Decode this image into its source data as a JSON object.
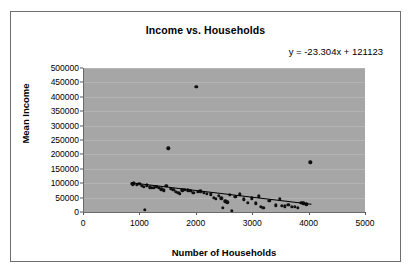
{
  "chart_data": {
    "type": "scatter",
    "title": "Income vs. Households",
    "xlabel": "Number of Households",
    "ylabel": "Mean Income",
    "xlim": [
      0,
      5000
    ],
    "ylim": [
      0,
      500000
    ],
    "xticks": [
      0,
      1000,
      2000,
      3000,
      4000,
      5000
    ],
    "yticks": [
      0,
      50000,
      100000,
      150000,
      200000,
      250000,
      300000,
      350000,
      400000,
      450000,
      500000
    ],
    "xtick_labels": [
      "0",
      "1000",
      "2000",
      "3000",
      "4000",
      "5000"
    ],
    "ytick_labels": [
      "0",
      "50000",
      "100000",
      "150000",
      "200000",
      "250000",
      "300000",
      "350000",
      "400000",
      "450000",
      "500000"
    ],
    "grid": "horizontal",
    "legend": "none",
    "plot_background": "#a6a6a6",
    "point_color": "#101010",
    "trendline_color": "#000000",
    "annotations": [
      {
        "name": "trendline-equation",
        "text": "y = -23.304x + 121123",
        "slope": -23.304,
        "intercept": 121123
      }
    ],
    "trendline": {
      "x_start": 850,
      "y_start": 101315,
      "x_end": 4050,
      "y_end": 26942
    },
    "series": [
      {
        "name": "Income vs Households",
        "points": [
          [
            860,
            98000
          ],
          [
            885,
            96500
          ],
          [
            905,
            99000
          ],
          [
            950,
            95000
          ],
          [
            1000,
            97000
          ],
          [
            1040,
            92000
          ],
          [
            1075,
            88000
          ],
          [
            1100,
            7000
          ],
          [
            1130,
            93000
          ],
          [
            1180,
            86000
          ],
          [
            1215,
            85000
          ],
          [
            1255,
            84000
          ],
          [
            1300,
            87000
          ],
          [
            1340,
            83000
          ],
          [
            1390,
            79000
          ],
          [
            1430,
            75000
          ],
          [
            1480,
            92000
          ],
          [
            1510,
            221000
          ],
          [
            1555,
            81000
          ],
          [
            1600,
            78000
          ],
          [
            1650,
            70000
          ],
          [
            1690,
            66000
          ],
          [
            1720,
            64000
          ],
          [
            1760,
            75000
          ],
          [
            1810,
            77000
          ],
          [
            1860,
            76000
          ],
          [
            1905,
            73000
          ],
          [
            1955,
            66000
          ],
          [
            2010,
            435000
          ],
          [
            2035,
            70000
          ],
          [
            2080,
            72000
          ],
          [
            2140,
            67000
          ],
          [
            2200,
            64000
          ],
          [
            2270,
            62000
          ],
          [
            2320,
            50000
          ],
          [
            2360,
            46000
          ],
          [
            2410,
            57000
          ],
          [
            2450,
            48000
          ],
          [
            2480,
            14000
          ],
          [
            2520,
            37000
          ],
          [
            2560,
            33000
          ],
          [
            2600,
            60000
          ],
          [
            2640,
            4000
          ],
          [
            2700,
            52000
          ],
          [
            2780,
            62000
          ],
          [
            2850,
            44000
          ],
          [
            2920,
            32000
          ],
          [
            2990,
            47000
          ],
          [
            3060,
            30000
          ],
          [
            3120,
            54000
          ],
          [
            3150,
            18000
          ],
          [
            3200,
            15000
          ],
          [
            3300,
            38000
          ],
          [
            3420,
            23000
          ],
          [
            3490,
            45000
          ],
          [
            3520,
            22000
          ],
          [
            3580,
            20000
          ],
          [
            3640,
            26000
          ],
          [
            3700,
            19000
          ],
          [
            3760,
            18000
          ],
          [
            3810,
            15000
          ],
          [
            3870,
            32000
          ],
          [
            3905,
            30000
          ],
          [
            3960,
            27000
          ],
          [
            4030,
            173000
          ]
        ]
      }
    ]
  }
}
